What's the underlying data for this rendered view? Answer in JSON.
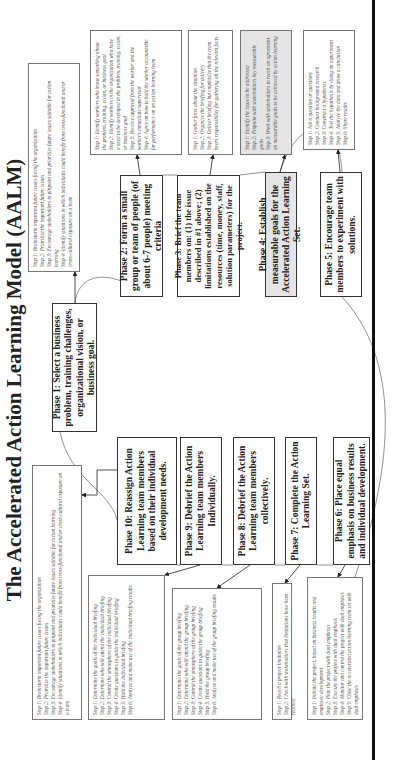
{
  "title": "The Accelerated Action Learning Model (AALM)",
  "colors": {
    "highlight_fill": "#e4e4e4",
    "border": "#333333",
    "text": "#222222"
  },
  "phases": [
    {
      "id": 1,
      "label": "Phase 1: Select a business problem, training challenges, organizational vision, or business goal."
    },
    {
      "id": 2,
      "label": "Phase 2: Form a small group or team of people (of about 6-7 people) meeting criteria"
    },
    {
      "id": 3,
      "label": "Phase 3: Brief the team members on: (1) the issue described in #1 above; (2) limitations established on the resources (time, money, staff, solution parameters) for the project."
    },
    {
      "id": 4,
      "label": "Phase 4: Establish measurable goals for the Accelerated Action Learning Set.",
      "highlighted": true
    },
    {
      "id": 5,
      "label": "Phase 5: Encourage team members to experiment with solutions."
    },
    {
      "id": 6,
      "label": "Phase 6: Place equal emphasis on business results and individual development."
    },
    {
      "id": 7,
      "label": "Phase 7: Complete the Action Learning Set."
    },
    {
      "id": 8,
      "label": "Phase 8: Debrief the Action Learning team members collectively."
    },
    {
      "id": 9,
      "label": "Phase 9: Debrief the Action Learning team members Individually."
    },
    {
      "id": 10,
      "label": "Phase 10: Reassign Action Learning team members based on their individual development needs."
    }
  ],
  "steps": {
    "p1": [
      "Step 1: Brainstorm important future issues facing the organization",
      "Step 2: Prioritize the important future issues",
      "Step 3: Encourage stakeholders to pinpoint and prioritize future issues suitable for action learning",
      "Step 4: Identify situations in which individuals could benefit from cross-functional and/or cross-cultural exposure on a team"
    ],
    "p2": [
      "Step 1: Identify workers who know something about the problem, training, vision, or business goal",
      "Step 2: Identify workers in the organization who have a need to be developed in the problem, training, vision, or business goal",
      "Step 3: Receive approval from the worker and the worker's immediate supervisor",
      "Step 4: Agree on how to hold the worker accountable for performance on an action learning team"
    ],
    "p3": [
      "Step 1: Gather facts about the situation",
      "Step 2: Organize the briefing for delivery",
      "Step 3: Deliver briefing but emphasize that the team bears responsibility for gathering all the relevant facts"
    ],
    "p4": [
      "Step 1: Identify the issue to be addressed",
      "Step 2: Pinpoint with stakeholders key measurable goals",
      "Step 3: Work with stakeholders to reach an agreement on measurable goals to be achieved by action learning"
    ],
    "p5": [
      "Step 1: Ask a question or questions",
      "Step 2: Conduct background research",
      "Step 3: Construct a hypothesis",
      "Step 4: Test the hypothesis by doing an experiment",
      "Step 5: Analyze the data and draw a conclusion",
      "Step 6: Share results"
    ],
    "p6": [
      "Step 1: Initiate the project, based on business results and employee development",
      "Step 2: Plan the project with dual emphasis",
      "Step 3: Execute the project with dual emphasis",
      "Step 4: Monitor and control the project with dual emphasis",
      "Step 5: Close the accelerated action learning team set with dual emphasis"
    ],
    "p7": [
      "Step 1: Reach a project limitation",
      "Step 2: Check with stakeholders that limitations have been reached"
    ],
    "p8": [
      "Step 1: Determine the goals of the group briefing",
      "Step 2: Determine who will attend the group briefing",
      "Step 3: Control the atmosphere of the group briefing",
      "Step 4: Create questions to guide the group briefing",
      "Step 5: Hold the group briefing",
      "Step 6: Analyze and make use of the group briefing results"
    ],
    "p9": [
      "Step 1: Determine the goals of the individual briefing",
      "Step 2: Determine who will attend the individual briefing",
      "Step 3: Control the atmosphere of the individual briefing",
      "Step 4: Create questions to guide the individual briefing",
      "Step 5: Hold the individual briefing",
      "Step 6: Analyze and make use of the individual briefing results"
    ],
    "p10": [
      "Step 1: Brainstorm important future issues facing the organization",
      "Step 2: Prioritize the important future issues",
      "Step 3: Encourage stakeholders to pinpoint and prioritize future issues suitable for action learning",
      "Step 4: Identify situations in which individuals could benefit from cross-functional and/or cross-cultural exposure on a team"
    ]
  }
}
